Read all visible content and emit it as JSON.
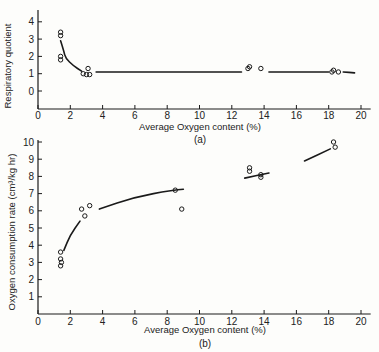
{
  "chart_data": [
    {
      "type": "scatter",
      "panel": "(a)",
      "title": "",
      "xlabel": "Average Oxygen content (%)",
      "ylabel": "Respiratory quotient",
      "xlim": [
        0,
        20
      ],
      "ylim": [
        -1,
        4.5
      ],
      "xticks": [
        "0",
        "2",
        "4",
        "6",
        "8",
        "10",
        "12",
        "14",
        "16",
        "18",
        "20"
      ],
      "yticks": [
        "0",
        "1",
        "2",
        "3",
        "4"
      ],
      "grid": false,
      "legend": null,
      "points": [
        {
          "x": 1.4,
          "y": 3.4
        },
        {
          "x": 1.4,
          "y": 3.2
        },
        {
          "x": 1.4,
          "y": 2.0
        },
        {
          "x": 1.4,
          "y": 1.8
        },
        {
          "x": 2.8,
          "y": 1.0
        },
        {
          "x": 3.0,
          "y": 0.95
        },
        {
          "x": 3.2,
          "y": 0.95
        },
        {
          "x": 3.1,
          "y": 1.3
        },
        {
          "x": 13.0,
          "y": 1.3
        },
        {
          "x": 13.1,
          "y": 1.4
        },
        {
          "x": 13.8,
          "y": 1.3
        },
        {
          "x": 18.2,
          "y": 1.1
        },
        {
          "x": 18.3,
          "y": 1.2
        },
        {
          "x": 18.6,
          "y": 1.1
        }
      ],
      "fit_curve": [
        {
          "x": 1.4,
          "y": 2.9
        },
        {
          "x": 1.6,
          "y": 2.3
        },
        {
          "x": 1.7,
          "y": 1.9
        },
        {
          "x": 2.2,
          "y": 1.45
        },
        {
          "x": 2.7,
          "y": 1.15
        },
        {
          "x": 3.6,
          "y": 1.1
        },
        {
          "x": 12.6,
          "y": 1.1
        },
        {
          "x": 14.3,
          "y": 1.1
        },
        {
          "x": 18.0,
          "y": 1.1
        },
        {
          "x": 18.9,
          "y": 1.1
        },
        {
          "x": 19.6,
          "y": 1.05
        }
      ]
    },
    {
      "type": "scatter",
      "panel": "(b)",
      "title": "",
      "xlabel": "Average Oxygen content (%)",
      "ylabel": "Oxygen consumption rate (cm³/kg hr)",
      "xlim": [
        0,
        20
      ],
      "ylim": [
        0,
        10
      ],
      "xticks": [
        "0",
        "2",
        "4",
        "6",
        "8",
        "10",
        "12",
        "14",
        "16",
        "18",
        "20"
      ],
      "yticks": [
        "1",
        "2",
        "3",
        "4",
        "5",
        "6",
        "7",
        "8",
        "9",
        "10"
      ],
      "grid": false,
      "legend": null,
      "points": [
        {
          "x": 1.4,
          "y": 3.6
        },
        {
          "x": 1.4,
          "y": 3.2
        },
        {
          "x": 1.45,
          "y": 3.0
        },
        {
          "x": 1.4,
          "y": 2.8
        },
        {
          "x": 2.7,
          "y": 6.1
        },
        {
          "x": 2.9,
          "y": 5.7
        },
        {
          "x": 3.2,
          "y": 6.3
        },
        {
          "x": 8.5,
          "y": 7.2
        },
        {
          "x": 8.9,
          "y": 6.1
        },
        {
          "x": 13.1,
          "y": 8.5
        },
        {
          "x": 13.1,
          "y": 8.3
        },
        {
          "x": 13.8,
          "y": 8.1
        },
        {
          "x": 13.8,
          "y": 7.95
        },
        {
          "x": 18.3,
          "y": 10.0
        },
        {
          "x": 18.4,
          "y": 9.7
        }
      ],
      "fit_curve": [
        {
          "x": 1.6,
          "y": 3.7
        },
        {
          "x": 2.0,
          "y": 4.6
        },
        {
          "x": 2.6,
          "y": 5.4
        },
        {
          "x": 3.8,
          "y": 6.1
        },
        {
          "x": 6.0,
          "y": 6.8
        },
        {
          "x": 8.3,
          "y": 7.2
        },
        {
          "x": 9.0,
          "y": 7.25
        },
        {
          "x": 12.8,
          "y": 7.9
        },
        {
          "x": 14.3,
          "y": 8.2
        },
        {
          "x": 16.5,
          "y": 8.9
        },
        {
          "x": 18.1,
          "y": 9.6
        }
      ]
    }
  ],
  "labels": {
    "panel_a": {
      "ylabel": "Respiratory quotient",
      "xlabel": "Average Oxygen content (%)",
      "caption": "(a)"
    },
    "panel_b": {
      "ylabel": "Oxygen consumption rate (cm³/kg hr)",
      "xlabel": "Average Oxygen content (%)",
      "caption": "(b)"
    }
  },
  "colors": {
    "ink": "#1a1a1a",
    "background": "#fdfdfb"
  }
}
